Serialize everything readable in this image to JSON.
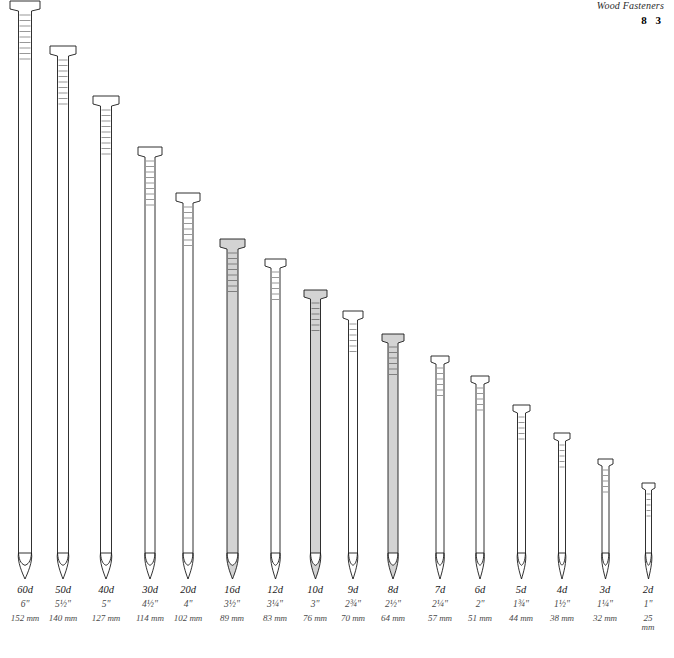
{
  "header": {
    "running_head": "Wood Fasteners",
    "page_number": "8 3"
  },
  "diagram": {
    "title_semantic": "common-nail-size-chart",
    "nails": [
      {
        "penny": "60d",
        "inches": "6\"",
        "mm": "152 mm",
        "shaded": false
      },
      {
        "penny": "50d",
        "inches": "5½\"",
        "mm": "140 mm",
        "shaded": false
      },
      {
        "penny": "40d",
        "inches": "5\"",
        "mm": "127 mm",
        "shaded": false
      },
      {
        "penny": "30d",
        "inches": "4½\"",
        "mm": "114 mm",
        "shaded": false
      },
      {
        "penny": "20d",
        "inches": "4\"",
        "mm": "102 mm",
        "shaded": false
      },
      {
        "penny": "16d",
        "inches": "3½\"",
        "mm": "89 mm",
        "shaded": true
      },
      {
        "penny": "12d",
        "inches": "3¼\"",
        "mm": "83 mm",
        "shaded": false
      },
      {
        "penny": "10d",
        "inches": "3\"",
        "mm": "76 mm",
        "shaded": true
      },
      {
        "penny": "9d",
        "inches": "2¾\"",
        "mm": "70 mm",
        "shaded": false
      },
      {
        "penny": "8d",
        "inches": "2½\"",
        "mm": "64 mm",
        "shaded": true
      },
      {
        "penny": "7d",
        "inches": "2¼\"",
        "mm": "57 mm",
        "shaded": false
      },
      {
        "penny": "6d",
        "inches": "2\"",
        "mm": "51 mm",
        "shaded": false
      },
      {
        "penny": "5d",
        "inches": "1¾\"",
        "mm": "44 mm",
        "shaded": false
      },
      {
        "penny": "4d",
        "inches": "1½\"",
        "mm": "38 mm",
        "shaded": false
      },
      {
        "penny": "3d",
        "inches": "1¼\"",
        "mm": "32 mm",
        "shaded": false
      },
      {
        "penny": "2d",
        "inches": "1\"",
        "mm": "25\nmm",
        "shaded": false
      }
    ]
  },
  "colors": {
    "outline": "#1a1a1a",
    "shaded_fill": "#d3d3d3",
    "plain_fill": "#ffffff",
    "text": "#1a1a1a"
  }
}
